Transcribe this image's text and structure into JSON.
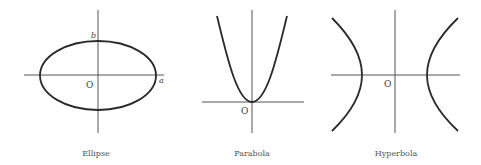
{
  "figures": [
    {
      "name": "ellipse",
      "caption": "Ellipse",
      "origin_label": "O",
      "semi_major_label": "a",
      "semi_minor_label": "b"
    },
    {
      "name": "parabola",
      "caption": "Parabola",
      "origin_label": "O"
    },
    {
      "name": "hyperbola",
      "caption": "Hyperbola",
      "origin_label": "O"
    }
  ],
  "colors": {
    "axis": "#555555",
    "curve": "#2a2a2a",
    "text": "#444444",
    "background": "#ffffff"
  }
}
